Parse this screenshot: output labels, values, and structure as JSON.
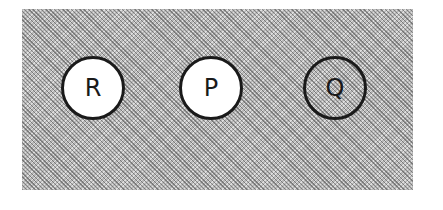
{
  "diagram": {
    "background": {
      "style": "hatched",
      "color": "#b8b8b8"
    },
    "nodes": [
      {
        "id": "R",
        "label": "R",
        "fill": "white",
        "cx": 95,
        "cy": 90
      },
      {
        "id": "P",
        "label": "P",
        "fill": "white",
        "cx": 213,
        "cy": 90
      },
      {
        "id": "Q",
        "label": "Q",
        "fill": "hatched",
        "cx": 337,
        "cy": 90
      }
    ]
  }
}
